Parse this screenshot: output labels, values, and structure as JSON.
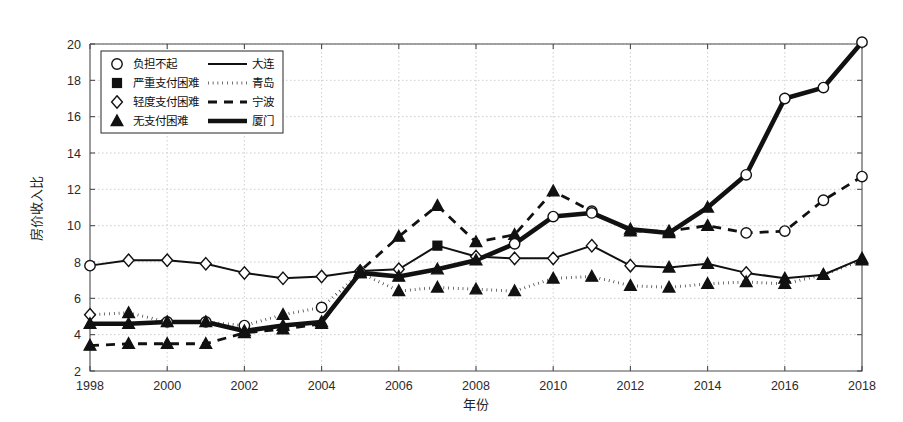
{
  "chart_data": {
    "type": "line",
    "title": "",
    "xlabel": "年份",
    "ylabel": "房价收入比",
    "xlim": [
      1998,
      2018
    ],
    "ylim": [
      2,
      20
    ],
    "xticks": [
      1998,
      2000,
      2002,
      2004,
      2006,
      2008,
      2010,
      2012,
      2014,
      2016,
      2018
    ],
    "yticks": [
      2,
      4,
      6,
      8,
      10,
      12,
      14,
      16,
      18,
      20
    ],
    "grid": true,
    "legend_position": "upper-left",
    "x": [
      1998,
      1999,
      2000,
      2001,
      2002,
      2003,
      2004,
      2005,
      2006,
      2007,
      2008,
      2009,
      2010,
      2011,
      2012,
      2013,
      2014,
      2015,
      2016,
      2017,
      2018
    ],
    "series": [
      {
        "name": "大连",
        "linestyle": "solid",
        "values": [
          7.8,
          8.1,
          8.1,
          7.9,
          7.4,
          7.1,
          7.2,
          7.5,
          7.6,
          8.9,
          8.3,
          8.2,
          8.2,
          8.9,
          7.8,
          7.7,
          7.9,
          7.4,
          7.1,
          7.3,
          8.2
        ]
      },
      {
        "name": "青岛",
        "linestyle": "dotted",
        "values": [
          5.1,
          5.2,
          4.7,
          4.7,
          4.5,
          5.1,
          5.5,
          7.4,
          6.4,
          6.6,
          6.5,
          6.4,
          7.1,
          7.2,
          6.7,
          6.6,
          6.8,
          6.9,
          6.8,
          7.3,
          8.1
        ]
      },
      {
        "name": "宁波",
        "linestyle": "dashed",
        "values": [
          3.4,
          3.5,
          3.5,
          3.5,
          4.1,
          4.3,
          4.6,
          7.5,
          9.4,
          11.1,
          9.1,
          9.5,
          11.9,
          10.8,
          9.7,
          9.7,
          10.0,
          9.6,
          9.7,
          11.4,
          12.7
        ]
      },
      {
        "name": "厦门",
        "linestyle": "solid-thick",
        "values": [
          4.6,
          4.6,
          4.7,
          4.7,
          4.2,
          4.5,
          4.7,
          7.4,
          7.2,
          7.6,
          8.1,
          9.0,
          10.5,
          10.7,
          9.8,
          9.6,
          11.0,
          12.8,
          17.0,
          17.6,
          20.1
        ]
      }
    ],
    "marker_legend": [
      {
        "marker": "circle-open",
        "label": "负担不起",
        "line": "solid",
        "city": "大连"
      },
      {
        "marker": "square-filled",
        "label": "严重支付困难",
        "line": "dotted",
        "city": "青岛"
      },
      {
        "marker": "diamond-open",
        "label": "轻度支付困难",
        "line": "dashed",
        "city": "宁波"
      },
      {
        "marker": "triangle-filled",
        "label": "无支付困难",
        "line": "solid-thick",
        "city": "厦门"
      }
    ],
    "marker_categories": {
      "大连": [
        "circle-open",
        "diamond-open",
        "diamond-open",
        "diamond-open",
        "diamond-open",
        "diamond-open",
        "diamond-open",
        "diamond-open",
        "diamond-open",
        "square-filled",
        "diamond-open",
        "diamond-open",
        "diamond-open",
        "diamond-open",
        "diamond-open",
        "triangle-filled",
        "triangle-filled",
        "diamond-open",
        "triangle-filled",
        "triangle-filled",
        "triangle-filled"
      ],
      "青岛": [
        "diamond-open",
        "triangle-filled",
        "circle-open",
        "circle-open",
        "circle-open",
        "triangle-filled",
        "circle-open",
        "triangle-filled",
        "triangle-filled",
        "triangle-filled",
        "triangle-filled",
        "triangle-filled",
        "triangle-filled",
        "triangle-filled",
        "triangle-filled",
        "triangle-filled",
        "triangle-filled",
        "triangle-filled",
        "triangle-filled",
        "triangle-filled",
        "triangle-filled"
      ],
      "宁波": [
        "triangle-filled",
        "triangle-filled",
        "triangle-filled",
        "triangle-filled",
        "triangle-filled",
        "triangle-filled",
        "triangle-filled",
        "triangle-filled",
        "triangle-filled",
        "triangle-filled",
        "triangle-filled",
        "triangle-filled",
        "triangle-filled",
        "circle-open",
        "triangle-filled",
        "triangle-filled",
        "triangle-filled",
        "circle-open",
        "circle-open",
        "circle-open",
        "circle-open"
      ],
      "厦门": [
        "triangle-filled",
        "triangle-filled",
        "triangle-filled",
        "triangle-filled",
        "triangle-filled",
        "triangle-filled",
        "triangle-filled",
        "triangle-filled",
        "triangle-filled",
        "triangle-filled",
        "triangle-filled",
        "circle-open",
        "circle-open",
        "circle-open",
        "triangle-filled",
        "triangle-filled",
        "triangle-filled",
        "circle-open",
        "circle-open",
        "circle-open",
        "circle-open"
      ]
    },
    "colors": {
      "series": "#111111",
      "grid": "#c8c8c8",
      "axis": "#4a4a4a",
      "background": "#ffffff"
    }
  }
}
